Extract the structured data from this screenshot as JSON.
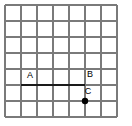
{
  "figure": {
    "canvas": {
      "width": 132,
      "height": 126,
      "background": "#ffffff"
    },
    "grid": {
      "origin_x": 5,
      "origin_y": 5,
      "cell_size": 16,
      "columns": 7,
      "rows": 7,
      "line_color": "#7a7a7a",
      "line_width": 1.2,
      "x_lines": [
        5,
        21,
        37,
        53,
        69,
        85,
        101,
        117
      ],
      "y_lines": [
        5,
        21,
        37,
        53,
        69,
        85,
        101,
        117
      ]
    },
    "segment": {
      "name": "segment-ab",
      "x1": 21,
      "y1": 85,
      "x2": 85,
      "y2": 85,
      "color": "#1a1a1a",
      "width": 2.4,
      "length_cells": 4
    },
    "point": {
      "name": "point-c",
      "x": 85,
      "y": 101,
      "radius": 3.2,
      "color": "#000000"
    },
    "labels": [
      {
        "id": "label-a",
        "text": "A",
        "x": 30,
        "y": 78,
        "color": "#000000",
        "font_size": 9
      },
      {
        "id": "label-b",
        "text": "B",
        "x": 90,
        "y": 77,
        "color": "#000000",
        "font_size": 9
      },
      {
        "id": "label-c",
        "text": "C",
        "x": 88,
        "y": 94,
        "color": "#000000",
        "font_size": 9
      }
    ]
  }
}
